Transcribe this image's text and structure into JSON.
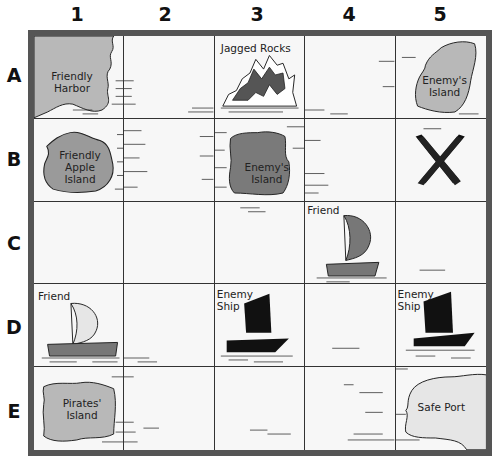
{
  "columns": [
    "1",
    "2",
    "3",
    "4",
    "5"
  ],
  "rows": [
    "A",
    "B",
    "C",
    "D",
    "E"
  ],
  "cells": {
    "A1": {
      "label": "Friendly Harbor",
      "line1": "Friendly",
      "line2": "Harbor",
      "type": "harbor"
    },
    "A3": {
      "label": "Jagged Rocks",
      "type": "rocks"
    },
    "A5": {
      "label": "Enemy's Island",
      "line1": "Enemy's",
      "line2": "Island",
      "type": "island"
    },
    "B1": {
      "label": "Friendly Apple Island",
      "line1": "Friendly",
      "line2": "Apple",
      "line3": "Island",
      "type": "island"
    },
    "B3": {
      "label": "Enemy's Island",
      "line1": "Enemy's",
      "line2": "Island",
      "type": "island"
    },
    "B5": {
      "label": "X",
      "type": "treasure-mark"
    },
    "C4": {
      "label": "Friend",
      "type": "friend-ship"
    },
    "D1": {
      "label": "Friend",
      "type": "friend-ship"
    },
    "D3": {
      "label": "Enemy Ship",
      "line1": "Enemy",
      "line2": "Ship",
      "type": "enemy-ship"
    },
    "D5": {
      "label": "Enemy Ship",
      "line1": "Enemy",
      "line2": "Ship",
      "type": "enemy-ship"
    },
    "E1": {
      "label": "Pirates' Island",
      "line1": "Pirates'",
      "line2": "Island",
      "type": "island"
    },
    "E5": {
      "label": "Safe Port",
      "type": "port"
    }
  },
  "colors": {
    "land": "#b8b8b8",
    "dark_land": "#7a7a7a",
    "enemy_ship": "#111111",
    "friend_hull": "#777777",
    "border": "#555555",
    "water": "#f7f7f7"
  }
}
